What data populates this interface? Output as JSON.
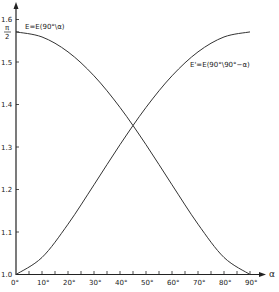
{
  "chart_data": {
    "type": "line",
    "title": "",
    "xlabel": "α",
    "ylabel": "",
    "x": [
      0,
      10,
      20,
      30,
      40,
      50,
      60,
      70,
      80,
      90
    ],
    "x_tick_labels": [
      "0°",
      "10°",
      "20°",
      "30°",
      "40°",
      "50°",
      "60°",
      "70°",
      "80°",
      "90°"
    ],
    "y_tick_labels": [
      "1.0",
      "1.1",
      "1.2",
      "1.3",
      "1.4",
      "1.5",
      "π/2",
      "1.6"
    ],
    "y_ticks": [
      1.0,
      1.1,
      1.2,
      1.3,
      1.4,
      1.5,
      1.5708,
      1.6
    ],
    "xlim": [
      0,
      90
    ],
    "ylim": [
      1.0,
      1.65
    ],
    "grid": false,
    "legend": "none (curves labeled inline)",
    "series": [
      {
        "name": "E = E(90°\\α)",
        "values": [
          1.5708,
          1.5589,
          1.5238,
          1.4675,
          1.3931,
          1.3055,
          1.2111,
          1.1184,
          1.0401,
          1.0
        ]
      },
      {
        "name": "E' = E(90°\\90° − α)",
        "values": [
          1.0,
          1.0401,
          1.1184,
          1.2111,
          1.3055,
          1.3931,
          1.4675,
          1.5238,
          1.5589,
          1.5708
        ]
      }
    ],
    "annotations": [
      {
        "text": "E=E(90°\\α)",
        "near": "top-left curve start"
      },
      {
        "text": "E'=E(90°\\90°−α)",
        "near": "right rising curve"
      }
    ]
  },
  "labels": {
    "curve1": "E=E(90°\\α)",
    "curve2": "E'=E(90°\\90°−α)",
    "x_axis": "α",
    "pi_num": "π",
    "pi_den": "2"
  }
}
